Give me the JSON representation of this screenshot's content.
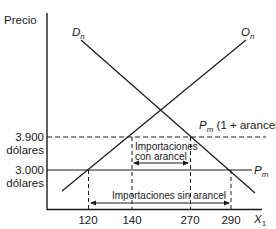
{
  "diagram": {
    "y_axis_label": "Precio",
    "x_axis_label": "X",
    "x_axis_subscript": "1",
    "demand_curve": {
      "letter": "D",
      "subscript": "n"
    },
    "supply_curve": {
      "letter": "O",
      "subscript": "n"
    },
    "price_with_tariff": {
      "letter": "P",
      "subscript": "m",
      "suffix": "(1 + arancel)",
      "value": "3.900",
      "unit": "dólares"
    },
    "world_price": {
      "letter": "P",
      "subscript": "m",
      "value": "3.000",
      "unit": "dólares"
    },
    "x_ticks": [
      "120",
      "140",
      "270",
      "290"
    ],
    "imports_with_tariff": {
      "line1": "Importaciones",
      "line2": "con arancel"
    },
    "imports_without_tariff": "Importaciones sin arancel",
    "colors": {
      "line": "#1a1a1a",
      "background": "#ffffff"
    }
  }
}
